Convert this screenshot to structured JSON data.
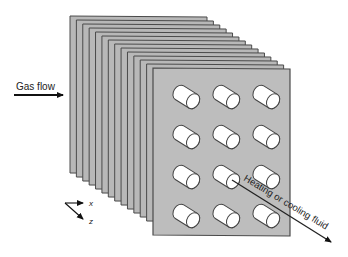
{
  "diagram": {
    "type": "plate heat exchanger with tube array",
    "plates": {
      "count": 14,
      "fill": "#b8b8b8",
      "edge": "#4a4a4a"
    },
    "tubes": {
      "rows": 4,
      "columns": 3,
      "fill": "#ffffff",
      "edge": "#444444"
    },
    "labels": {
      "gas_flow": "Gas flow",
      "fluid": "Heating or cooling fluid",
      "axis_x": "x",
      "axis_z": "z"
    }
  }
}
